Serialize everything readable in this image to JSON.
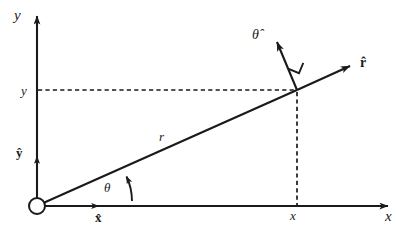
{
  "figure": {
    "background_color": "#ffffff",
    "stroke_color": "#1a1a1a",
    "width": 408,
    "height": 235
  },
  "axes": {
    "y_axis_label": "y",
    "x_axis_label": "x",
    "origin_marker": "open-circle"
  },
  "ticks": {
    "y_tick_label": "y",
    "x_tick_label": "x"
  },
  "labels": {
    "radius_label": "r",
    "angle_label": "θ",
    "r_hat_label": "r̂",
    "theta_hat_label": "θ̂",
    "x_hat_label": "x̂",
    "y_hat_label": "ŷ"
  },
  "geometry": {
    "origin": {
      "x": 37,
      "y": 206
    },
    "point": {
      "x": 297,
      "y": 90
    },
    "y_axis_tip": {
      "x": 37,
      "y": 12
    },
    "x_axis_tip": {
      "x": 393,
      "y": 206
    },
    "r_hat_tip": {
      "x": 355,
      "y": 62
    },
    "theta_hat_tip": {
      "x": 272,
      "y": 36
    },
    "x_hat_tip": {
      "x": 103,
      "y": 206
    },
    "y_hat_tip": {
      "x": 37,
      "y": 152
    },
    "theta_arc_radius": 58,
    "theta_degrees": 24.5,
    "right_angle_marker": true,
    "dashed_horizontal": {
      "from_x": 38,
      "to_x": 297,
      "y": 90
    },
    "dashed_vertical": {
      "x": 297,
      "from_y": 90,
      "to_y": 206
    }
  }
}
